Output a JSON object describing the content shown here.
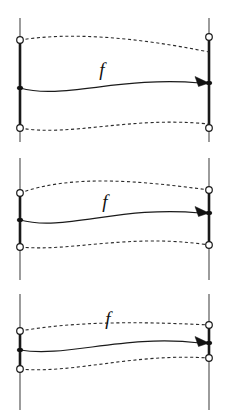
{
  "figure": {
    "title": "",
    "width": 229,
    "height": 420,
    "background_color": "#ffffff",
    "stroke_color": "#1a1a1a",
    "fiber_color": "#4a4a4a",
    "dash_color": "#2b2b2b",
    "panel_count": 3
  },
  "panels": [
    {
      "id": "panel-1",
      "label": "f",
      "label_x": 102,
      "label_y": 76,
      "left_fiber": {
        "x": 20,
        "top_y": 18,
        "bottom_y": 142,
        "bold_top_y": 40,
        "bold_bottom_y": 128,
        "circles_y": [
          40,
          128
        ],
        "dot_y": 88
      },
      "right_fiber": {
        "x": 209,
        "top_y": 18,
        "bottom_y": 142,
        "bold_top_y": 37,
        "bold_bottom_y": 128,
        "circles_y": [
          37,
          128
        ],
        "dot_y": 83
      },
      "top_dashed_path": "M 20 40 C 70 32, 135 37, 209 52",
      "bottom_dashed_path": "M 20 128 C 70 137, 130 116, 209 124",
      "solid_path": "M 20 88 C 62 100, 120 76, 200 83",
      "arrow_tip": {
        "x": 209,
        "y": 83
      }
    },
    {
      "id": "panel-2",
      "label": "f",
      "label_x": 105,
      "label_y": 208,
      "left_fiber": {
        "x": 20,
        "top_y": 158,
        "bottom_y": 280,
        "bold_top_y": 193,
        "bold_bottom_y": 247,
        "circles_y": [
          193,
          247
        ],
        "dot_y": 220
      },
      "right_fiber": {
        "x": 209,
        "top_y": 158,
        "bottom_y": 280,
        "bold_top_y": 190,
        "bold_bottom_y": 245,
        "circles_y": [
          190,
          245
        ],
        "dot_y": 213
      },
      "top_dashed_path": "M 20 193 C 70 175, 135 180, 209 190",
      "bottom_dashed_path": "M 20 247 C 72 252, 130 233, 209 245",
      "solid_path": "M 20 220 C 64 232, 122 205, 200 213",
      "arrow_tip": {
        "x": 209,
        "y": 213
      }
    },
    {
      "id": "panel-3",
      "label": "f",
      "label_x": 108,
      "label_y": 325,
      "left_fiber": {
        "x": 20,
        "top_y": 294,
        "bottom_y": 410,
        "bold_top_y": 331,
        "bold_bottom_y": 369,
        "circles_y": [
          331,
          369
        ],
        "dot_y": 350
      },
      "right_fiber": {
        "x": 209,
        "top_y": 294,
        "bottom_y": 410,
        "bold_top_y": 325,
        "bold_bottom_y": 358,
        "circles_y": [
          325,
          358
        ],
        "dot_y": 343
      },
      "top_dashed_path": "M 20 331 C 72 322, 132 321, 209 325",
      "bottom_dashed_path": "M 20 369 C 74 374, 132 353, 209 358",
      "solid_path": "M 20 350 C 66 358, 124 334, 200 343",
      "arrow_tip": {
        "x": 209,
        "y": 343
      }
    }
  ],
  "legend": {
    "map_label": "f",
    "endpoint_marker": "open-circle",
    "basepoint_marker": "filled-dot"
  }
}
